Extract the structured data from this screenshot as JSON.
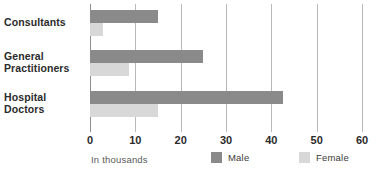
{
  "chart_data": {
    "type": "bar",
    "orientation": "horizontal",
    "title": "",
    "subtitle": "",
    "xlabel": "In thousands",
    "ylabel": "",
    "xlim": [
      0,
      60
    ],
    "xticks": [
      0,
      10,
      20,
      30,
      40,
      50,
      60
    ],
    "xtick_labels": [
      "0",
      "10",
      "20",
      "30",
      "40",
      "50",
      "60"
    ],
    "grid": true,
    "grid_axis": "x",
    "legend_position": "bottom",
    "categories": [
      "Consultants",
      "General Practitioners",
      "Hospital Doctors"
    ],
    "category_lines": [
      [
        "Consultants"
      ],
      [
        "General",
        "Practitioners"
      ],
      [
        "Hospital",
        "Doctors"
      ]
    ],
    "series": [
      {
        "name": "Male",
        "color": "#8a8a8a",
        "values": [
          15,
          25,
          42.5
        ]
      },
      {
        "name": "Female",
        "color": "#d8d8d8",
        "values": [
          2.8,
          8.5,
          15
        ]
      }
    ]
  },
  "legend": {
    "entries": [
      {
        "label": "Male",
        "color": "#8a8a8a"
      },
      {
        "label": "Female",
        "color": "#d8d8d8"
      }
    ]
  },
  "footer": {
    "axis_caption": "In thousands"
  },
  "colors": {
    "male": "#8a8a8a",
    "female": "#d8d8d8",
    "gridline": "#b9b9b9",
    "axis": "#8f8f8f",
    "label_text": "#2b2b2b",
    "caption_text": "#5a5a5a",
    "background": "#ffffff"
  }
}
